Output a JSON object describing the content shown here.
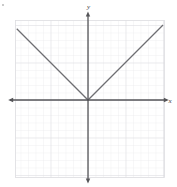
{
  "figure": {
    "title": "",
    "x_axis_label": "x",
    "y_axis_label": "y",
    "bullet_marker": "•"
  },
  "colors": {
    "background": "#ffffff",
    "grid_minor": "#e2e2e6",
    "grid_major": "#d2d2d8",
    "axis": "#555558",
    "curve": "#6e6e72",
    "label": "#3a3a3a"
  },
  "chart_data": {
    "type": "line",
    "title": "",
    "xlabel": "x",
    "ylabel": "y",
    "grid": true,
    "legend": null,
    "xlim": [
      -9.7,
      10.3
    ],
    "ylim": [
      -10.4,
      10.7
    ],
    "x_tick_step": 1,
    "y_tick_step": 1,
    "tick_labels_visible": false,
    "series": [
      {
        "name": "y = |x|",
        "equation": "y = |x|",
        "vertex": [
          0,
          0
        ],
        "left_slope": -1,
        "right_slope": 1,
        "x": [
          -9.5,
          0,
          10.0
        ],
        "values": [
          9.5,
          0,
          10.0
        ],
        "points": [
          {
            "x": -9.5,
            "y": 9.5
          },
          {
            "x": -5,
            "y": 5
          },
          {
            "x": 0,
            "y": 0
          },
          {
            "x": 5,
            "y": 5
          },
          {
            "x": 10.0,
            "y": 10.0
          }
        ]
      }
    ],
    "annotations": [
      {
        "text": "x",
        "position": "x-axis-right-end"
      },
      {
        "text": "y",
        "position": "y-axis-top-end"
      }
    ]
  }
}
